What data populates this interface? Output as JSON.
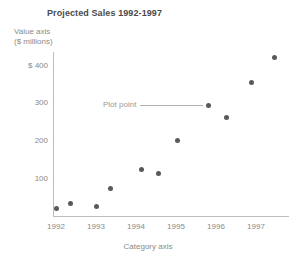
{
  "chart_data": {
    "type": "scatter",
    "title": "Projected Sales 1992-1997",
    "xlabel": "Category axis",
    "ylabel": "Value axis ($ millions)",
    "ylabel_line1": "Value axis",
    "ylabel_line2": "($ millions)",
    "grid": false,
    "legend": "none",
    "xlim": [
      1991.6,
      1997.8
    ],
    "ylim": [
      0,
      440
    ],
    "xticks": [
      "1992",
      "1993",
      "1994",
      "1995",
      "1996",
      "1997"
    ],
    "xtick_values": [
      1992,
      1993,
      1994,
      1995,
      1996,
      1997
    ],
    "yticks": [
      "$ 400",
      "300",
      "200",
      "100"
    ],
    "ytick_values": [
      400,
      300,
      200,
      100
    ],
    "marker_color": "#595959",
    "axis_color": "#bdbdbd",
    "text_color": "#8a8a8a",
    "title_color": "#4a4a4a",
    "points": [
      {
        "x": 1992.0,
        "y": 20,
        "px": 56,
        "py": 208
      },
      {
        "x": 1992.35,
        "y": 35,
        "px": 70,
        "py": 203
      },
      {
        "x": 1993.0,
        "y": 25,
        "px": 96,
        "py": 206
      },
      {
        "x": 1993.35,
        "y": 72,
        "px": 110,
        "py": 188
      },
      {
        "x": 1994.1,
        "y": 123,
        "px": 141,
        "py": 169
      },
      {
        "x": 1994.52,
        "y": 113,
        "px": 158,
        "py": 173
      },
      {
        "x": 1995.0,
        "y": 200,
        "px": 177,
        "py": 140
      },
      {
        "x": 1995.78,
        "y": 277,
        "px": 208,
        "py": 105
      },
      {
        "x": 1996.22,
        "y": 245,
        "px": 226,
        "py": 117
      },
      {
        "x": 1996.8,
        "y": 340,
        "px": 251,
        "py": 82
      },
      {
        "x": 1997.38,
        "y": 405,
        "px": 274,
        "py": 57
      }
    ],
    "annotations": [
      {
        "text": "Plot point",
        "label_x": 103,
        "label_y": 100,
        "line_x": 140,
        "line_y": 105,
        "line_width": 63,
        "target_point_index": 7
      }
    ]
  },
  "axis_geometry": {
    "y_axis_x": 53,
    "y_axis_top": 52,
    "y_axis_height": 165,
    "x_axis_y": 216,
    "x_axis_left": 53,
    "x_axis_width": 236,
    "ytick_pixel_y": [
      65,
      102,
      140,
      178
    ],
    "xtick_pixel_x": [
      56,
      96,
      136,
      176,
      216,
      256
    ],
    "xtick_label_y": 222
  }
}
